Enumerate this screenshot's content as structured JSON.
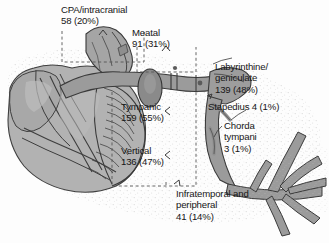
{
  "figure": {
    "type": "anatomical-diagram",
    "background_color": "#fdfdfd",
    "nerve_color": "#9a9a9a",
    "nerve_outline": "#3c3c3c",
    "bone_color": "#b0b0b0",
    "text_color": "#161616",
    "dash_color": "#555555"
  },
  "labels": {
    "cpa": {
      "name": "CPA/intracranial",
      "count": "58",
      "percent": "(20%)",
      "text": "CPA/intracranial\n58 (20%)"
    },
    "meatal": {
      "name": "Meatal",
      "count": "91",
      "percent": "(31%)",
      "text": "Meatal\n91 (31%)"
    },
    "labyrinthine_geniculate": {
      "name": "Labyrinthine/geniculate",
      "count": "139",
      "percent": "(48%)",
      "text": "Labyrinthine/\ngeniculate\n139 (48%)"
    },
    "stapedius": {
      "name": "Stapedius",
      "count": "4",
      "percent": "(1%)",
      "text": "Stapedius 4 (1%)"
    },
    "chorda_tympani": {
      "name": "Chorda tympani",
      "count": "3",
      "percent": "(1%)",
      "text": "Chorda\ntympani\n3 (1%)"
    },
    "tympanic": {
      "name": "Tympanic",
      "count": "159",
      "percent": "(55%)",
      "text": "Tympanic\n159 (55%)"
    },
    "vertical": {
      "name": "Vertical",
      "count": "136",
      "percent": "(47%)",
      "text": "Vertical\n136 (47%)"
    },
    "infratemporal_peripheral": {
      "name": "Infratemporal and peripheral",
      "count": "41",
      "percent": "(14%)",
      "text": "Infratemporal and\nperipheral\n41 (14%)"
    }
  }
}
